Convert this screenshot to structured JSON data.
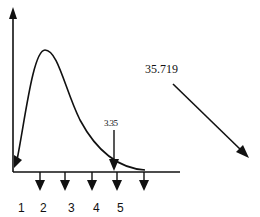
{
  "diagram": {
    "value_label": "35.719",
    "marker_label": "3.35",
    "tick_labels": [
      "1",
      "2",
      "3",
      "4",
      "5"
    ],
    "colors": {
      "ink": "#111111",
      "background": "#ffffff"
    }
  }
}
